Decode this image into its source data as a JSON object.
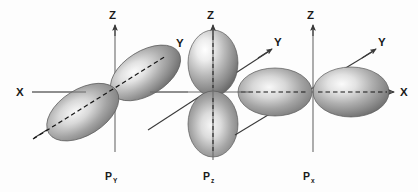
{
  "figure": {
    "background_color": "#fdfdfd",
    "width": 418,
    "height": 192,
    "axis_color": "#6b6b6b",
    "lobe_light": "#f2f2f2",
    "lobe_mid": "#a8a8a8",
    "lobe_dark": "#6e6e6e"
  },
  "panels": [
    {
      "id": "py",
      "orbital_label_main": "P",
      "orbital_label_sub": "Y",
      "orientation": "along-y-axis",
      "origin": {
        "x": 115,
        "y": 92
      },
      "axes": [
        {
          "name": "Z",
          "label": "Z",
          "direction": "up"
        },
        {
          "name": "X",
          "label": "X",
          "direction": "left-right"
        },
        {
          "name": "Y",
          "label": "Y",
          "direction": "diagonal-upper-right"
        }
      ],
      "lobes": 2,
      "lobe_axis": "Y"
    },
    {
      "id": "pz",
      "orbital_label_main": "P",
      "orbital_label_sub": "z",
      "orientation": "along-z-axis",
      "origin": {
        "x": 213,
        "y": 92
      },
      "axes": [
        {
          "name": "Z",
          "label": "Z",
          "direction": "up"
        },
        {
          "name": "X",
          "label": "X",
          "direction": "left-right"
        },
        {
          "name": "Y",
          "label": "Y",
          "direction": "diagonal-upper-right"
        }
      ],
      "lobes": 2,
      "lobe_axis": "Z"
    },
    {
      "id": "px",
      "orbital_label_main": "P",
      "orbital_label_sub": "x",
      "orientation": "along-x-axis",
      "origin": {
        "x": 313,
        "y": 92
      },
      "axes": [
        {
          "name": "Z",
          "label": "Z",
          "direction": "up"
        },
        {
          "name": "X",
          "label": "X",
          "direction": "left-right"
        },
        {
          "name": "Y",
          "label": "Y",
          "direction": "diagonal-upper-right"
        }
      ],
      "lobes": 2,
      "lobe_axis": "X"
    }
  ],
  "axis_labels": {
    "x_left": "X",
    "x_right": "X",
    "z": "Z",
    "y": "Y"
  }
}
